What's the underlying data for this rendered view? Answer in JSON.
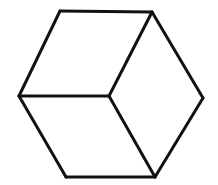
{
  "diagram": {
    "type": "isometric-cube-line-drawing",
    "width": 218,
    "height": 185,
    "background": "#ffffff",
    "stroke_color": "#111111",
    "stroke_width": 3,
    "vertices": {
      "top_left": [
        60,
        11
      ],
      "top_right": [
        152,
        12
      ],
      "right": [
        203,
        98
      ],
      "bottom_right": [
        155,
        177
      ],
      "bottom_left": [
        66,
        177
      ],
      "left": [
        19,
        96
      ],
      "center": [
        109,
        96
      ]
    },
    "edges": [
      {
        "name": "top-edge",
        "from": "top_left",
        "to": "top_right"
      },
      {
        "name": "upper-right-edge",
        "from": "top_right",
        "to": "right"
      },
      {
        "name": "lower-right-edge",
        "from": "right",
        "to": "bottom_right"
      },
      {
        "name": "bottom-edge",
        "from": "bottom_right",
        "to": "bottom_left"
      },
      {
        "name": "lower-left-edge",
        "from": "bottom_left",
        "to": "left"
      },
      {
        "name": "upper-left-edge",
        "from": "left",
        "to": "top_left"
      },
      {
        "name": "inner-left-edge",
        "from": "left",
        "to": "center"
      },
      {
        "name": "inner-top-edge",
        "from": "center",
        "to": "top_right"
      },
      {
        "name": "inner-bottom-edge",
        "from": "center",
        "to": "bottom_right"
      }
    ]
  }
}
